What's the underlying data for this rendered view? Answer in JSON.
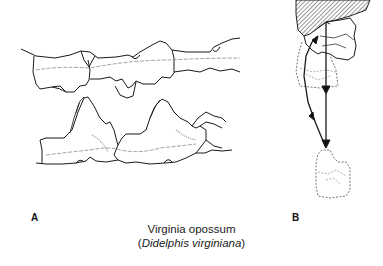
{
  "figure": {
    "panels": [
      {
        "label": "A",
        "subject": "lateral view of upper and lower molar rows"
      },
      {
        "label": "B",
        "subject": "occlusal movement path of lower tooth relative to upper tooth"
      }
    ],
    "caption": {
      "common_name": "Virginia opossum",
      "open_paren": "(",
      "scientific_name": "Didelphis virginiana",
      "close_paren": ")"
    },
    "colors": {
      "line": "#1a1a1a",
      "dashed": "#555555",
      "background": "#ffffff"
    }
  }
}
